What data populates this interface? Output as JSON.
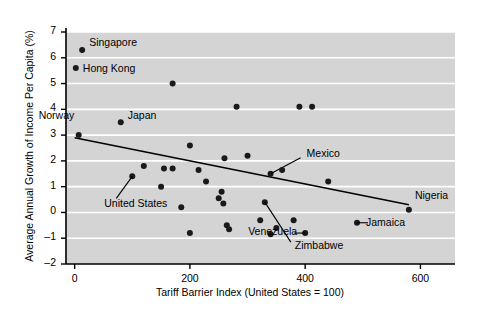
{
  "chart_data": {
    "type": "scatter",
    "title": "",
    "xlabel": "Tariff Barrier Index (United States = 100)",
    "ylabel": "Average Annual Growth of Income Per Capita (%)",
    "xlim": [
      -15,
      660
    ],
    "ylim": [
      -2,
      7
    ],
    "xticks": [
      0,
      200,
      400,
      600
    ],
    "yticks": [
      -2,
      -1,
      0,
      1,
      2,
      3,
      4,
      5,
      6,
      7
    ],
    "grid": "horizontal-white-on-gray",
    "plot_bg": "#d4d4d4",
    "point_color": "#1a1a1a",
    "legend": "none",
    "points": [
      {
        "x": 13,
        "y": 6.3,
        "label": "Singapore"
      },
      {
        "x": 2,
        "y": 5.6,
        "label": "Hong Kong"
      },
      {
        "x": 80,
        "y": 3.5,
        "label": "Japan"
      },
      {
        "x": 7,
        "y": 3.0,
        "label": "Norway"
      },
      {
        "x": 100,
        "y": 1.4,
        "label": "United States"
      },
      {
        "x": 340,
        "y": 1.5,
        "label": "Mexico"
      },
      {
        "x": 400,
        "y": -0.8,
        "label": "Venezuela"
      },
      {
        "x": 330,
        "y": 0.4,
        "label": "Zimbabwe"
      },
      {
        "x": 490,
        "y": -0.4,
        "label": "Jamaica"
      },
      {
        "x": 580,
        "y": 0.1,
        "label": "Nigeria"
      },
      {
        "x": 170,
        "y": 5.0,
        "label": ""
      },
      {
        "x": 390,
        "y": 4.1,
        "label": ""
      },
      {
        "x": 412,
        "y": 4.1,
        "label": ""
      },
      {
        "x": 281,
        "y": 4.1,
        "label": ""
      },
      {
        "x": 200,
        "y": 2.6,
        "label": ""
      },
      {
        "x": 260,
        "y": 2.1,
        "label": ""
      },
      {
        "x": 300,
        "y": 2.2,
        "label": ""
      },
      {
        "x": 120,
        "y": 1.8,
        "label": ""
      },
      {
        "x": 155,
        "y": 1.7,
        "label": ""
      },
      {
        "x": 170,
        "y": 1.7,
        "label": ""
      },
      {
        "x": 215,
        "y": 1.65,
        "label": ""
      },
      {
        "x": 360,
        "y": 1.65,
        "label": ""
      },
      {
        "x": 440,
        "y": 1.2,
        "label": ""
      },
      {
        "x": 228,
        "y": 1.2,
        "label": ""
      },
      {
        "x": 150,
        "y": 1.0,
        "label": ""
      },
      {
        "x": 255,
        "y": 0.8,
        "label": ""
      },
      {
        "x": 250,
        "y": 0.55,
        "label": ""
      },
      {
        "x": 258,
        "y": 0.35,
        "label": ""
      },
      {
        "x": 185,
        "y": 0.2,
        "label": ""
      },
      {
        "x": 322,
        "y": -0.3,
        "label": ""
      },
      {
        "x": 380,
        "y": -0.3,
        "label": ""
      },
      {
        "x": 264,
        "y": -0.5,
        "label": ""
      },
      {
        "x": 268,
        "y": -0.65,
        "label": ""
      },
      {
        "x": 350,
        "y": -0.6,
        "label": ""
      },
      {
        "x": 200,
        "y": -0.8,
        "label": ""
      },
      {
        "x": 340,
        "y": -0.85,
        "label": ""
      }
    ],
    "trendline": {
      "x0": 0,
      "y0": 2.9,
      "x1": 580,
      "y1": 0.3
    }
  }
}
